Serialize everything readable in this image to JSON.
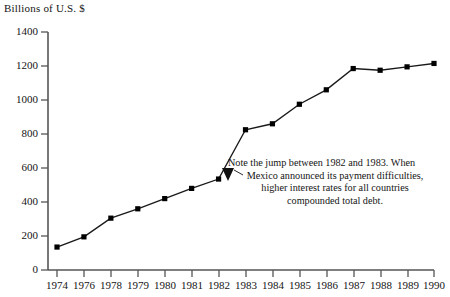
{
  "chart_data": {
    "type": "line",
    "title": "",
    "ylabel": "Billions of U.S. $",
    "xlabel": "",
    "categories": [
      "1974",
      "1976",
      "1978",
      "1979",
      "1980",
      "1981",
      "1982",
      "1983",
      "1984",
      "1985",
      "1986",
      "1987",
      "1988",
      "1989",
      "1990"
    ],
    "values": [
      135,
      195,
      305,
      360,
      420,
      480,
      535,
      825,
      860,
      975,
      1060,
      1185,
      1175,
      1195,
      1215
    ],
    "x": [
      1974,
      1976,
      1978,
      1979,
      1980,
      1981,
      1982,
      1983,
      1984,
      1985,
      1986,
      1987,
      1988,
      1989,
      1990
    ],
    "ylim": [
      0,
      1400
    ],
    "yticks": [
      0,
      200,
      400,
      600,
      800,
      1000,
      1200,
      1400
    ],
    "ytick_labels": [
      "0",
      "200",
      "400",
      "600",
      "800",
      "1000",
      "1200",
      "1400"
    ],
    "grid": false,
    "legend": null,
    "marker": "square",
    "series": [
      {
        "name": "Total debt",
        "values": [
          135,
          195,
          305,
          360,
          420,
          480,
          535,
          825,
          860,
          975,
          1060,
          1185,
          1175,
          1195,
          1215
        ]
      }
    ],
    "annotations": [
      {
        "name": "jump-note",
        "lines": [
          "Note the jump between 1982 and 1983. When",
          "Mexico announced its payment difficulties,",
          "higher interest rates for all countries",
          "compounded total debt."
        ],
        "points_to": "1983"
      }
    ],
    "colors": {
      "line": "#1a1a1a",
      "marker": "#000000",
      "axis": "#555555",
      "text": "#141414",
      "background": "#ffffff"
    }
  }
}
